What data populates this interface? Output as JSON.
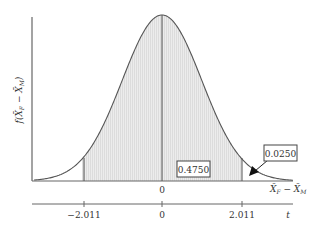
{
  "chart_data": {
    "type": "area",
    "title": "",
    "ylabel": "f(X̄_F − X̄_M)",
    "xlabel": "X̄_F − X̄_M",
    "secondary_xlabel": "t",
    "distribution": "bell curve (t distribution)",
    "x_axis_ticks": [
      "0"
    ],
    "t_axis_ticks": [
      "−2.011",
      "0",
      "2.011"
    ],
    "critical_values": [
      -2.011,
      2.011
    ],
    "shaded_region": [
      -2.011,
      2.011
    ],
    "annotations": [
      {
        "label": "0.4750",
        "meaning": "area between 0 and 2.011"
      },
      {
        "label": "0.0250",
        "meaning": "right tail area beyond 2.011",
        "arrow": true
      }
    ],
    "grid": false,
    "legend": null
  },
  "labels": {
    "y_axis": "f(X̄F − X̄M)",
    "x_axis_main": "X̄F − X̄M",
    "x_axis_t": "t",
    "x_tick_zero": "0",
    "t_tick_neg": "−2.011",
    "t_tick_zero": "0",
    "t_tick_pos": "2.011",
    "area_center": "0.4750",
    "area_tail": "0.0250"
  },
  "colors": {
    "line": "#555555",
    "shade": "#e6e6e6",
    "text": "#333333"
  }
}
